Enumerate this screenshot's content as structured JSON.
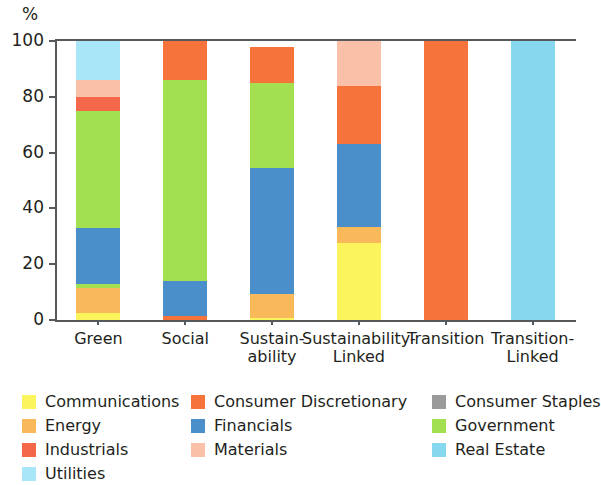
{
  "axis": {
    "y_unit": "%",
    "y_ticks": [
      "0",
      "20",
      "40",
      "60",
      "80",
      "100"
    ],
    "y_min": 0,
    "y_max": 100
  },
  "legend": {
    "columns": [
      [
        {
          "label": "Communications",
          "color": "#fcf45c",
          "key": "communications"
        },
        {
          "label": "Energy",
          "color": "#f9b95a",
          "key": "energy"
        },
        {
          "label": "Industrials",
          "color": "#f4674a",
          "key": "industrials"
        },
        {
          "label": "Utilities",
          "color": "#a9e6f7",
          "key": "utilities"
        }
      ],
      [
        {
          "label": "Consumer Discretionary",
          "color": "#f6743c",
          "key": "consumer_discretionary"
        },
        {
          "label": "Financials",
          "color": "#4a8fca",
          "key": "financials"
        },
        {
          "label": "Materials",
          "color": "#fac0a8",
          "key": "materials"
        }
      ],
      [
        {
          "label": "Consumer Staples",
          "color": "#9a9a9a",
          "key": "consumer_staples"
        },
        {
          "label": "Government",
          "color": "#a3e051",
          "key": "government"
        },
        {
          "label": "Real Estate",
          "color": "#85d8ee",
          "key": "real_estate"
        }
      ]
    ]
  },
  "chart_data": {
    "type": "bar",
    "stacked": true,
    "title": "",
    "xlabel": "",
    "ylabel": "%",
    "ylim": [
      0,
      100
    ],
    "grid": false,
    "legend_position": "bottom",
    "categories": [
      "Green",
      "Social",
      "Sustain-\nability",
      "Sustainability-\nLinked",
      "Transition",
      "Transition-\nLinked"
    ],
    "category_labels": [
      [
        "Green"
      ],
      [
        "Social"
      ],
      [
        "Sustain-",
        "ability"
      ],
      [
        "Sustainability-",
        "Linked"
      ],
      [
        "Transition"
      ],
      [
        "Transition-",
        "Linked"
      ]
    ],
    "series": [
      {
        "name": "Communications",
        "color": "#fcf45c",
        "values": [
          2.5,
          0,
          0.7,
          27.5,
          0,
          0
        ]
      },
      {
        "name": "Energy",
        "color": "#f9b95a",
        "values": [
          9.0,
          0,
          8.8,
          6.0,
          0,
          0
        ]
      },
      {
        "name": "Consumer Discretionary",
        "color": "#f6743c",
        "values": [
          0,
          1.5,
          0,
          0,
          100,
          0
        ]
      },
      {
        "name": "Government",
        "color": "#a3e051",
        "values": [
          1.5,
          0,
          0,
          0,
          0,
          0
        ]
      },
      {
        "name": "Financials",
        "color": "#4a8fca",
        "values": [
          20.0,
          12.5,
          45.0,
          29.5,
          0,
          0
        ]
      },
      {
        "name": "Government (main)",
        "color": "#a3e051",
        "values": [
          42.0,
          72.0,
          30.5,
          0,
          0,
          0
        ]
      },
      {
        "name": "Industrials",
        "color": "#f4674a",
        "values": [
          5.0,
          0,
          0,
          0,
          0,
          0
        ]
      },
      {
        "name": "Consumer Discretionary (top)",
        "color": "#f6743c",
        "values": [
          0,
          14.0,
          13.0,
          21.0,
          0,
          0
        ]
      },
      {
        "name": "Materials",
        "color": "#fac0a8",
        "values": [
          6.0,
          0,
          0,
          16.0,
          0,
          0
        ]
      },
      {
        "name": "Utilities",
        "color": "#a9e6f7",
        "values": [
          14.0,
          0,
          0,
          0,
          0,
          0
        ]
      },
      {
        "name": "Real Estate",
        "color": "#85d8ee",
        "values": [
          0,
          0,
          0,
          0,
          0,
          100
        ]
      }
    ],
    "bars": [
      {
        "category": "Green",
        "total": 100,
        "segments": [
          {
            "name": "Communications",
            "value": 2.5,
            "color": "#fcf45c"
          },
          {
            "name": "Energy",
            "value": 9.0,
            "color": "#f9b95a"
          },
          {
            "name": "Government",
            "value": 1.5,
            "color": "#a3e051"
          },
          {
            "name": "Financials",
            "value": 20.0,
            "color": "#4a8fca"
          },
          {
            "name": "Government",
            "value": 42.0,
            "color": "#a3e051"
          },
          {
            "name": "Industrials",
            "value": 5.0,
            "color": "#f4674a"
          },
          {
            "name": "Materials",
            "value": 6.0,
            "color": "#fac0a8"
          },
          {
            "name": "Utilities",
            "value": 14.0,
            "color": "#a9e6f7"
          }
        ]
      },
      {
        "category": "Social",
        "total": 100,
        "segments": [
          {
            "name": "Consumer Discretionary",
            "value": 1.5,
            "color": "#f6743c"
          },
          {
            "name": "Financials",
            "value": 12.5,
            "color": "#4a8fca"
          },
          {
            "name": "Government",
            "value": 72.0,
            "color": "#a3e051"
          },
          {
            "name": "Consumer Discretionary",
            "value": 14.0,
            "color": "#f6743c"
          }
        ]
      },
      {
        "category": "Sustainability",
        "total": 98,
        "segments": [
          {
            "name": "Communications",
            "value": 0.7,
            "color": "#fcf45c"
          },
          {
            "name": "Energy",
            "value": 8.8,
            "color": "#f9b95a"
          },
          {
            "name": "Financials",
            "value": 45.0,
            "color": "#4a8fca"
          },
          {
            "name": "Government",
            "value": 30.5,
            "color": "#a3e051"
          },
          {
            "name": "Consumer Discretionary",
            "value": 13.0,
            "color": "#f6743c"
          }
        ]
      },
      {
        "category": "Sustainability-Linked",
        "total": 100,
        "segments": [
          {
            "name": "Communications",
            "value": 27.5,
            "color": "#fcf45c"
          },
          {
            "name": "Energy",
            "value": 6.0,
            "color": "#f9b95a"
          },
          {
            "name": "Financials",
            "value": 29.5,
            "color": "#4a8fca"
          },
          {
            "name": "Consumer Discretionary",
            "value": 21.0,
            "color": "#f6743c"
          },
          {
            "name": "Materials",
            "value": 16.0,
            "color": "#fac0a8"
          }
        ]
      },
      {
        "category": "Transition",
        "total": 100,
        "segments": [
          {
            "name": "Consumer Discretionary",
            "value": 100.0,
            "color": "#f6743c"
          }
        ]
      },
      {
        "category": "Transition-Linked",
        "total": 100,
        "segments": [
          {
            "name": "Real Estate",
            "value": 100.0,
            "color": "#85d8ee"
          }
        ]
      }
    ]
  }
}
